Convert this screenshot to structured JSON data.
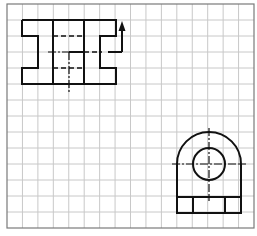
{
  "diagram": {
    "type": "orthographic-technical-drawing",
    "grid": {
      "left": 7,
      "top": 4,
      "right": 254,
      "bottom": 228,
      "columns": 16,
      "rows": 14,
      "line_color": "#c8c8c8",
      "border_color": "#7a7a7a"
    },
    "stroke_color": "#111111",
    "views": [
      {
        "name": "front-view",
        "outline": "22,20 116,20 116,36 100,36 100,68 116,68 116,84 22,84 22,68 38,68 38,36 22,36 22,20",
        "solid_lines": [
          [
            53,
            20,
            53,
            84
          ],
          [
            84,
            20,
            84,
            84
          ],
          [
            69,
            52,
            84,
            52
          ],
          [
            108,
            52,
            122,
            52
          ],
          [
            122,
            52,
            122,
            30
          ]
        ],
        "hidden_lines": [
          [
            53,
            36,
            84,
            36
          ],
          [
            53,
            68,
            84,
            68
          ],
          [
            84,
            52,
            102,
            52
          ]
        ],
        "center_lines": [
          [
            48,
            52,
            69,
            52
          ],
          [
            69,
            52,
            69,
            93
          ]
        ],
        "arrow": {
          "x": 122,
          "tip_y": 21,
          "base_y": 31
        }
      },
      {
        "name": "side-view",
        "outer_arc": {
          "cx": 209,
          "cy": 164,
          "r": 32
        },
        "hole": {
          "cx": 209,
          "cy": 164,
          "r": 16
        },
        "body": {
          "left": 177,
          "right": 241,
          "top": 164,
          "bottom": 213
        },
        "base_line_y": 197,
        "base_dividers_x": [
          193,
          225
        ],
        "center_lines": [
          [
            172,
            164,
            246,
            164
          ],
          [
            209,
            128,
            209,
            201
          ]
        ]
      }
    ]
  }
}
